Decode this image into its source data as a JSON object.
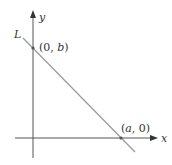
{
  "diagram": {
    "axes": {
      "x_label": "x",
      "y_label": "y"
    },
    "line_label": "L",
    "points": [
      {
        "label_prefix": "(0, ",
        "var": "b",
        "label_suffix": ")"
      },
      {
        "label_prefix": "(",
        "var": "a",
        "label_suffix": ", 0)"
      }
    ],
    "colors": {
      "axis": "#555555",
      "line": "#999999",
      "point": "#555555"
    }
  }
}
